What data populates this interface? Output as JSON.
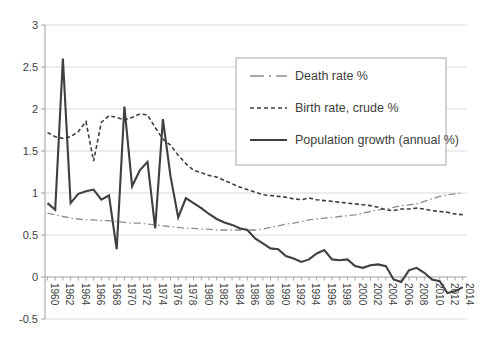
{
  "chart_data": {
    "type": "line",
    "title": "",
    "xlabel": "",
    "ylabel": "",
    "grid": true,
    "legend_position": "upper-right-inside",
    "xlim": [
      1960,
      2014
    ],
    "ylim": [
      -0.5,
      3
    ],
    "x": [
      1960,
      1961,
      1962,
      1963,
      1964,
      1965,
      1966,
      1967,
      1968,
      1969,
      1970,
      1971,
      1972,
      1973,
      1974,
      1975,
      1976,
      1977,
      1978,
      1979,
      1980,
      1981,
      1982,
      1983,
      1984,
      1985,
      1986,
      1987,
      1988,
      1989,
      1990,
      1991,
      1992,
      1993,
      1994,
      1995,
      1996,
      1997,
      1998,
      1999,
      2000,
      2001,
      2002,
      2003,
      2004,
      2005,
      2006,
      2007,
      2008,
      2009,
      2010,
      2011,
      2012,
      2013,
      2014
    ],
    "x_tick_labels": [
      "1960",
      "1962",
      "1964",
      "1966",
      "1968",
      "1970",
      "1972",
      "1974",
      "1976",
      "1978",
      "1980",
      "1982",
      "1984",
      "1986",
      "1988",
      "1990",
      "1992",
      "1994",
      "1996",
      "1998",
      "2000",
      "2002",
      "2004",
      "2006",
      "2008",
      "2010",
      "2012",
      "2014"
    ],
    "y_tick_values": [
      3,
      2.5,
      2,
      1.5,
      1,
      0.5,
      0,
      -0.5
    ],
    "y_tick_labels": [
      "3",
      "2.5",
      "2",
      "1.5",
      "1",
      "0.5",
      "0",
      "-0.5"
    ],
    "colors": {
      "dark_series": "#3f3f3f",
      "gray_series": "#8c8c8c",
      "gridline": "#d9d9d9",
      "axis": "#9e9e9e",
      "text": "#404040",
      "legend_border": "#a6a6a6",
      "background": "#ffffff"
    },
    "series": [
      {
        "name": "Death rate %",
        "style": "dashdot",
        "color": "#8c8c8c",
        "width": 1.3,
        "values": [
          0.76,
          0.74,
          0.72,
          0.7,
          0.69,
          0.68,
          0.68,
          0.67,
          0.67,
          0.66,
          0.65,
          0.64,
          0.64,
          0.63,
          0.62,
          0.61,
          0.6,
          0.59,
          0.58,
          0.58,
          0.57,
          0.57,
          0.56,
          0.56,
          0.56,
          0.56,
          0.56,
          0.56,
          0.57,
          0.59,
          0.61,
          0.63,
          0.64,
          0.66,
          0.68,
          0.69,
          0.7,
          0.71,
          0.72,
          0.73,
          0.74,
          0.76,
          0.78,
          0.8,
          0.81,
          0.83,
          0.85,
          0.86,
          0.87,
          0.9,
          0.93,
          0.96,
          0.98,
          0.99,
          1.0
        ]
      },
      {
        "name": "Birth rate, crude %",
        "style": "dashed",
        "color": "#3f3f3f",
        "width": 1.6,
        "values": [
          1.72,
          1.67,
          1.65,
          1.67,
          1.73,
          1.85,
          1.38,
          1.84,
          1.92,
          1.9,
          1.87,
          1.9,
          1.94,
          1.93,
          1.78,
          1.64,
          1.57,
          1.45,
          1.35,
          1.27,
          1.24,
          1.21,
          1.19,
          1.15,
          1.11,
          1.07,
          1.04,
          1.01,
          0.98,
          0.97,
          0.96,
          0.95,
          0.93,
          0.92,
          0.94,
          0.92,
          0.91,
          0.9,
          0.89,
          0.88,
          0.87,
          0.86,
          0.85,
          0.83,
          0.8,
          0.79,
          0.81,
          0.81,
          0.82,
          0.81,
          0.79,
          0.78,
          0.77,
          0.75,
          0.74
        ]
      },
      {
        "name": "Population growth (annual %)",
        "style": "solid",
        "color": "#3f3f3f",
        "width": 2.1,
        "values": [
          0.88,
          0.8,
          2.6,
          0.88,
          0.99,
          1.02,
          1.04,
          0.92,
          0.97,
          0.33,
          2.03,
          1.08,
          1.27,
          1.37,
          0.58,
          1.88,
          1.2,
          0.71,
          0.94,
          0.88,
          0.82,
          0.75,
          0.69,
          0.65,
          0.62,
          0.58,
          0.56,
          0.46,
          0.4,
          0.34,
          0.33,
          0.25,
          0.22,
          0.18,
          0.21,
          0.28,
          0.32,
          0.21,
          0.2,
          0.21,
          0.13,
          0.11,
          0.14,
          0.15,
          0.13,
          -0.03,
          -0.06,
          0.08,
          0.11,
          0.05,
          -0.03,
          -0.05,
          -0.19,
          -0.17,
          -0.12
        ]
      }
    ]
  }
}
